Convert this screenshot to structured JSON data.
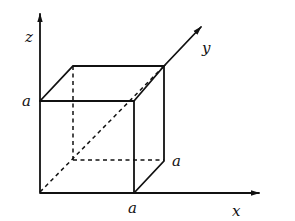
{
  "diagram": {
    "type": "3d-cube-coordinate-axes",
    "axes": {
      "x": {
        "label": "x"
      },
      "y": {
        "label": "y"
      },
      "z": {
        "label": "z"
      }
    },
    "edge_length_label": "a",
    "labels": {
      "z_a": "a",
      "x_a": "a",
      "y_a": "a"
    },
    "colors": {
      "ink": "#111111",
      "background": "#ffffff"
    }
  }
}
